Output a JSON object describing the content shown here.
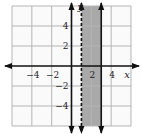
{
  "chart_data": {
    "type": "area",
    "title": "",
    "xlabel": "x",
    "ylabel": "y",
    "xlim": [
      -6,
      6
    ],
    "ylim": [
      -6,
      6
    ],
    "grid": true,
    "grid_step": 2,
    "x_ticks": [
      {
        "value": -4,
        "label": "−4"
      },
      {
        "value": -2,
        "label": "−2"
      },
      {
        "value": 2,
        "label": "2"
      },
      {
        "value": 4,
        "label": "4"
      }
    ],
    "y_ticks": [
      {
        "value": 4,
        "label": "4"
      },
      {
        "value": 2,
        "label": "2"
      },
      {
        "value": -2,
        "label": "−2"
      },
      {
        "value": -4,
        "label": "−4"
      }
    ],
    "boundary_lines": [
      {
        "name": "x = 1",
        "x": 1,
        "style": "dashed",
        "inclusive": false
      },
      {
        "name": "x = 3",
        "x": 3,
        "style": "solid",
        "inclusive": true
      }
    ],
    "shaded_region": {
      "x_from": 1,
      "x_to": 3,
      "description": "1 < x ≤ 3"
    },
    "colors": {
      "shade": "#a9a9a9",
      "grid": "#b5b5b5",
      "axis": "#111111"
    }
  }
}
